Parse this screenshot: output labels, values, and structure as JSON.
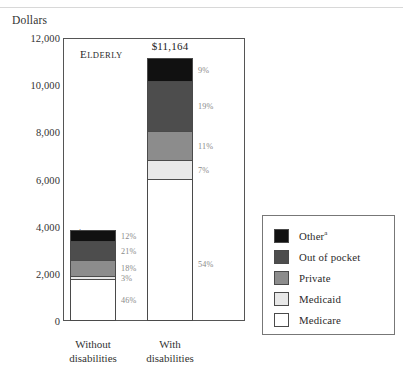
{
  "figure": {
    "ylabel": "Dollars",
    "panel_label": "Elderly"
  },
  "axis": {
    "ticks": [
      "12,000",
      "10,000",
      "8,000",
      "6,000",
      "4,000",
      "2,000",
      "0"
    ],
    "tick_values": [
      12000,
      10000,
      8000,
      6000,
      4000,
      2000,
      0
    ],
    "ymin": 0,
    "ymax": 12000
  },
  "bars": {
    "left": {
      "category_line1": "Without",
      "category_line2": "disabilities",
      "total_label": "$3,853",
      "total_value": 3853,
      "percents": {
        "other": "12%",
        "out_of_pocket": "21%",
        "private": "18%",
        "medicaid": "3%",
        "medicare": "46%"
      }
    },
    "right": {
      "category_line1": "With",
      "category_line2": "disabilities",
      "total_label": "$11,164",
      "total_value": 11164,
      "percents": {
        "other": "9%",
        "out_of_pocket": "19%",
        "private": "11%",
        "medicaid": "7%",
        "medicare": "54%"
      }
    }
  },
  "legend": {
    "items": [
      {
        "label": "Other",
        "superscript": "a",
        "color": "#111111"
      },
      {
        "label": "Out of pocket",
        "superscript": "",
        "color": "#4d4d4d"
      },
      {
        "label": "Private",
        "superscript": "",
        "color": "#8c8c8c"
      },
      {
        "label": "Medicaid",
        "superscript": "",
        "color": "#e8e8e8"
      },
      {
        "label": "Medicare",
        "superscript": "",
        "color": "#ffffff"
      }
    ]
  },
  "colors": {
    "other": "#111111",
    "out_of_pocket": "#4d4d4d",
    "private": "#8c8c8c",
    "medicaid": "#e8e8e8",
    "medicare": "#ffffff",
    "axis": "#555555",
    "pct_text": "#8a8a8a"
  },
  "chart_data": {
    "type": "bar",
    "subtype": "stacked-vertical",
    "title": "",
    "panel_label": "Elderly",
    "xlabel": "",
    "ylabel": "Dollars",
    "ylim": [
      0,
      12000
    ],
    "ytick_values": [
      0,
      2000,
      4000,
      6000,
      8000,
      10000,
      12000
    ],
    "ytick_labels": [
      "0",
      "2,000",
      "4,000",
      "6,000",
      "8,000",
      "10,000",
      "12,000"
    ],
    "grid": false,
    "legend_position": "right",
    "categories": [
      "Without disabilities",
      "With disabilities"
    ],
    "category_totals": [
      3853,
      11164
    ],
    "category_total_labels": [
      "$3,853",
      "$11,164"
    ],
    "stack_order_bottom_to_top": [
      "Medicare",
      "Medicaid",
      "Private",
      "Out of pocket",
      "Other"
    ],
    "series": [
      {
        "name": "Medicare",
        "percents": [
          46,
          54
        ],
        "percent_labels": [
          "46%",
          "54%"
        ],
        "values": [
          1772,
          6029
        ],
        "color": "#ffffff"
      },
      {
        "name": "Medicaid",
        "percents": [
          3,
          7
        ],
        "percent_labels": [
          "3%",
          "7%"
        ],
        "values": [
          116,
          781
        ],
        "color": "#e8e8e8"
      },
      {
        "name": "Private",
        "percents": [
          18,
          11
        ],
        "percent_labels": [
          "18%",
          "11%"
        ],
        "values": [
          694,
          1228
        ],
        "color": "#8c8c8c"
      },
      {
        "name": "Out of pocket",
        "percents": [
          21,
          19
        ],
        "percent_labels": [
          "21%",
          "19%"
        ],
        "values": [
          809,
          2121
        ],
        "color": "#4d4d4d"
      },
      {
        "name": "Other",
        "percents": [
          12,
          9
        ],
        "percent_labels": [
          "12%",
          "9%"
        ],
        "values": [
          462,
          1005
        ],
        "color": "#111111"
      }
    ],
    "legend_entries": [
      "Other a",
      "Out of pocket",
      "Private",
      "Medicaid",
      "Medicare"
    ],
    "annotations": [
      "Elderly",
      "$3,853",
      "$11,164"
    ]
  }
}
